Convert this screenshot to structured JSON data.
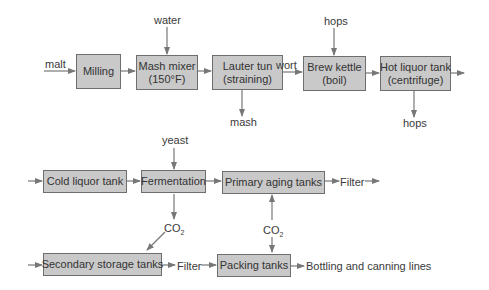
{
  "diagram": {
    "type": "process-flow",
    "colors": {
      "box_fill": "#c9c9c9",
      "box_border": "#6e6e6e",
      "arrow": "#777777",
      "text": "#333333"
    },
    "row1": {
      "milling": "Milling",
      "mash_mixer": [
        "Mash mixer",
        "(150°F)"
      ],
      "lauter_tun": [
        "Lauter tun",
        "(straining)"
      ],
      "brew_kettle": [
        "Brew kettle",
        "(boil)"
      ],
      "hot_liquor_tank": [
        "Hot liquor tank",
        "(centrifuge)"
      ]
    },
    "row1_labels": {
      "malt": "malt",
      "water": "water",
      "mash": "mash",
      "wort": "wort",
      "hops_in": "hops",
      "hops_out": "hops"
    },
    "row2": {
      "cold_liquor_tank": "Cold liquor tank",
      "fermentation": "Fermentation",
      "primary_aging_tanks": "Primary aging tanks",
      "filter": "Filter"
    },
    "row2_labels": {
      "yeast": "yeast",
      "co2_left": "CO",
      "co2_right": "CO",
      "co2_sub": "2"
    },
    "row3": {
      "secondary_storage_tanks": "Secondary storage tanks",
      "filter": "Filter",
      "packing_tanks": "Packing tanks",
      "bottling": "Bottling and canning lines"
    }
  }
}
